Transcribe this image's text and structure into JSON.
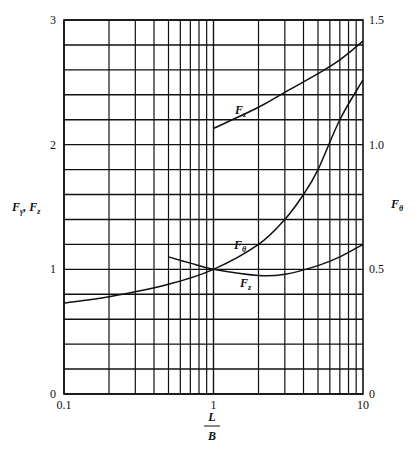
{
  "chart_data": {
    "type": "line",
    "title": "",
    "xlabel": "L/B",
    "xlabel_num": "L",
    "xlabel_den": "B",
    "x_scale": "log",
    "xlim": [
      0.1,
      10
    ],
    "x_tick_labels": [
      "0.1",
      "1",
      "10"
    ],
    "ylabel_left": "Fγ, Fz",
    "ylim_left": [
      0,
      3
    ],
    "y_left_tick_labels": [
      "0",
      "1",
      "2",
      "3"
    ],
    "ylabel_right": "Fθ",
    "ylim_right": [
      0,
      1.5
    ],
    "y_right_tick_labels": [
      "0",
      "0.5",
      "1.0",
      "1.5"
    ],
    "grid": true,
    "series": [
      {
        "name": "Fz (upper)",
        "label": "Fz",
        "axis": "left",
        "x": [
          1,
          2,
          3,
          5,
          7,
          10
        ],
        "y": [
          2.13,
          2.3,
          2.42,
          2.57,
          2.68,
          2.83
        ]
      },
      {
        "name": "Fθ",
        "label": "Fθ",
        "axis": "left",
        "x": [
          0.1,
          0.2,
          0.5,
          1,
          2,
          3,
          4,
          5,
          7,
          10
        ],
        "y": [
          0.73,
          0.78,
          0.88,
          1.0,
          1.2,
          1.4,
          1.6,
          1.8,
          2.2,
          2.52
        ],
        "y_right": [
          0.365,
          0.39,
          0.44,
          0.5,
          0.6,
          0.7,
          0.8,
          0.9,
          1.1,
          1.26
        ]
      },
      {
        "name": "Fz (lower)",
        "label": "Fz",
        "axis": "left",
        "x": [
          0.5,
          0.7,
          1,
          2,
          3,
          5,
          7,
          10
        ],
        "y": [
          1.1,
          1.05,
          1.0,
          0.95,
          0.96,
          1.03,
          1.1,
          1.2
        ]
      }
    ]
  },
  "labels": {
    "left_axis_main": "F",
    "left_axis_sub1": "γ",
    "left_axis_sep": ", ",
    "left_axis_main2": "F",
    "left_axis_sub2": "z",
    "right_axis_main": "F",
    "right_axis_sub": "θ",
    "curve_upper_main": "F",
    "curve_upper_sub": "z",
    "curve_theta_main": "F",
    "curve_theta_sub": "θ",
    "curve_lower_main": "F",
    "curve_lower_sub": "z"
  }
}
